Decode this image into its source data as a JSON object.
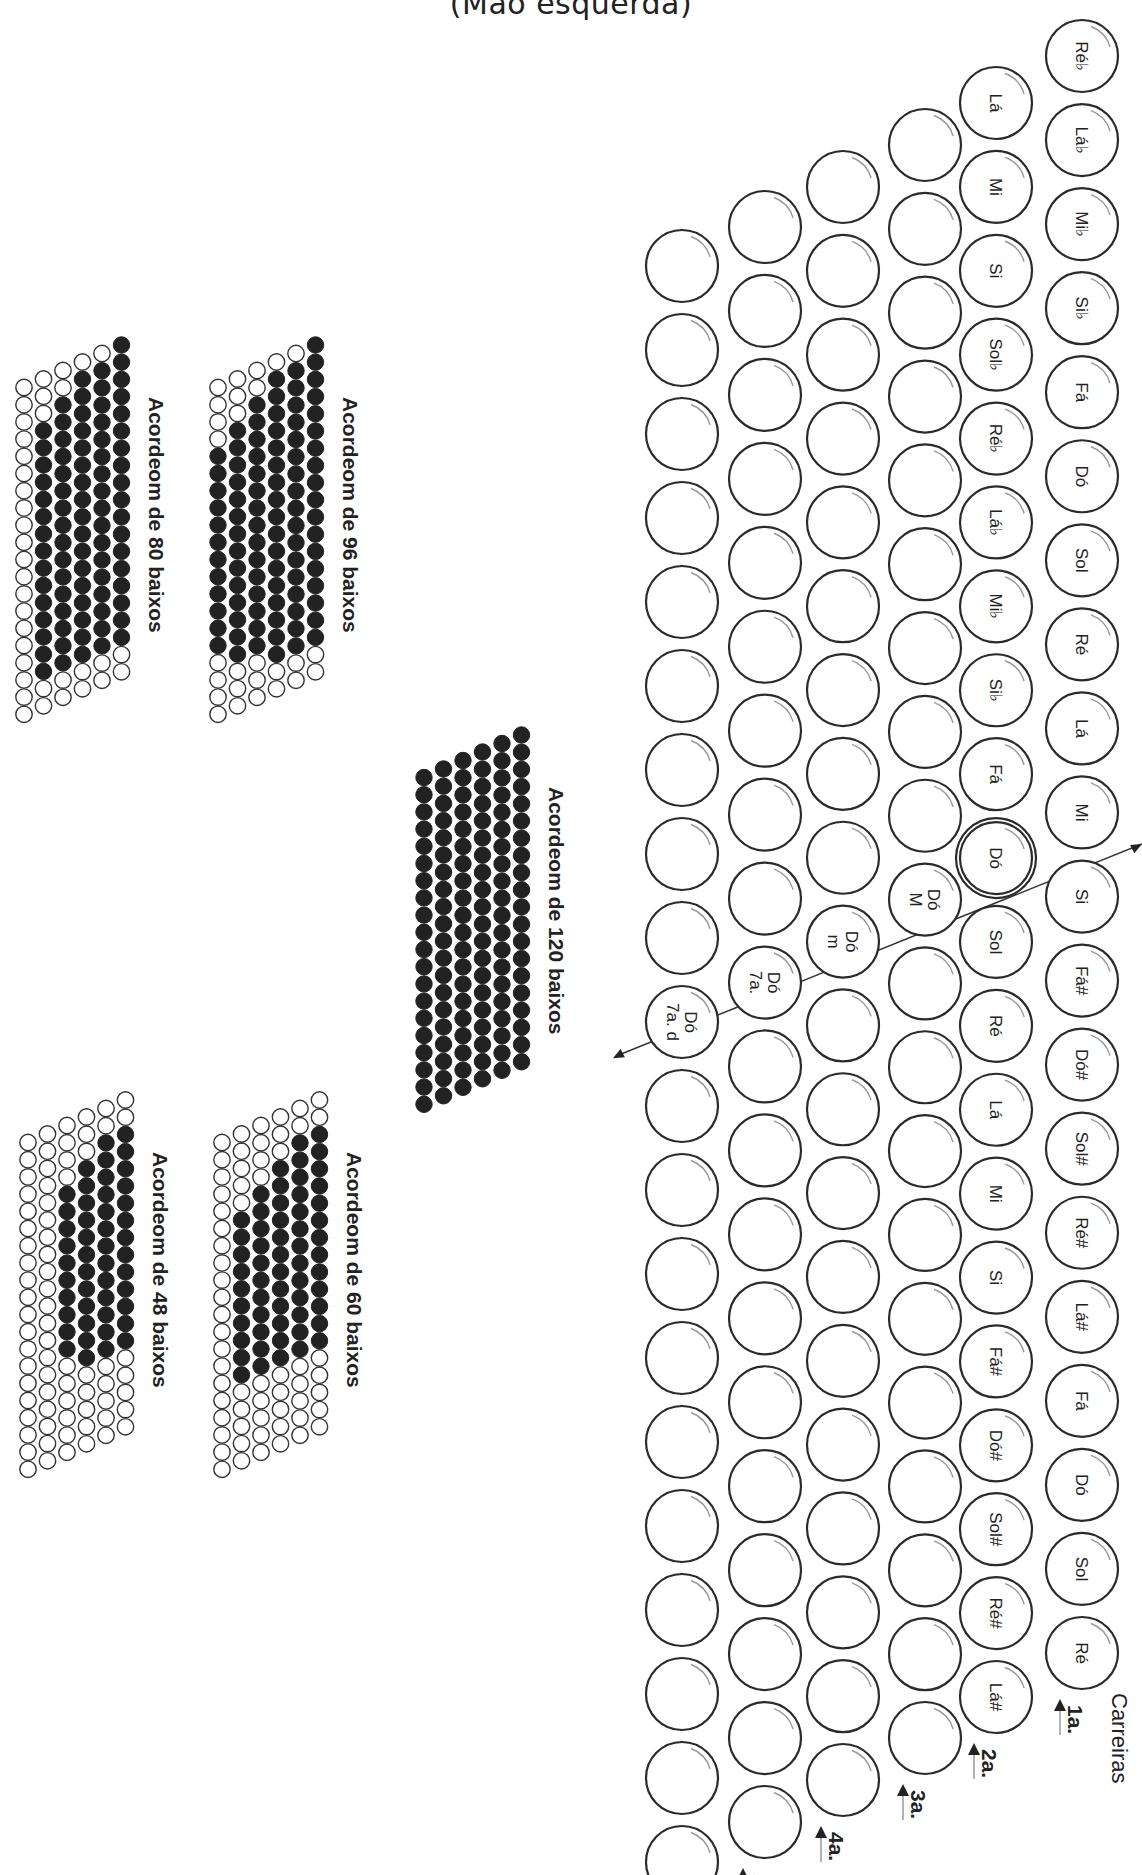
{
  "title": "(Mão esquerda)",
  "carreiras_label": "Carreiras",
  "rows": [
    {
      "label": "1a.",
      "x": 1082,
      "y0": 56,
      "y1": 1653,
      "buttons": [
        "Ré♭",
        "Lá♭",
        "Mi♭",
        "Si♭",
        "Fá",
        "Dó",
        "Sol",
        "Ré",
        "Lá",
        "Mi",
        "Si",
        "Fá#",
        "Dó#",
        "Sol#",
        "Ré#",
        "Lá#",
        "Fá",
        "Dó",
        "Sol",
        "Ré"
      ]
    },
    {
      "label": "2a.",
      "x": 996,
      "y0": 103,
      "y1": 1697,
      "buttons": [
        "Lá",
        "Mi",
        "Si",
        "Sol♭",
        "Ré♭",
        "Lá♭",
        "Mi♭",
        "Si♭",
        "Fá",
        "Dó",
        "Sol",
        "Ré",
        "Lá",
        "Mi",
        "Si",
        "Fá#",
        "Dó#",
        "Sol#",
        "Ré#",
        "Lá#"
      ]
    },
    {
      "label": "3a.",
      "x": 925,
      "y0": 145,
      "y1": 1738,
      "buttons": [
        "",
        "",
        "",
        "",
        "",
        "",
        "",
        "",
        "",
        "Dó\nM",
        "",
        "",
        "",
        "",
        "",
        "",
        "",
        "",
        "",
        ""
      ]
    },
    {
      "label": "4a.",
      "x": 843,
      "y0": 187,
      "y1": 1780,
      "buttons": [
        "",
        "",
        "",
        "",
        "",
        "",
        "",
        "",
        "",
        "Dó\nm",
        "",
        "",
        "",
        "",
        "",
        "",
        "",
        "",
        "",
        ""
      ]
    },
    {
      "label": "5a.",
      "x": 765,
      "y0": 227,
      "y1": 1822,
      "buttons": [
        "",
        "",
        "",
        "",
        "",
        "",
        "",
        "",
        "",
        "Dó\n7a.",
        "",
        "",
        "",
        "",
        "",
        "",
        "",
        "",
        "",
        ""
      ]
    },
    {
      "label": "6a.",
      "x": 682,
      "y0": 266,
      "y1": 1862,
      "buttons": [
        "",
        "",
        "",
        "",
        "",
        "",
        "",
        "",
        "",
        "Dó\n7a. d",
        "",
        "",
        "",
        "",
        "",
        "",
        "",
        "",
        "",
        ""
      ]
    }
  ],
  "highlighted_button": {
    "row": 1,
    "index": 9,
    "label": "Dó"
  },
  "layouts": [
    {
      "caption": "Acordeom de 96 baixos",
      "x": 218,
      "y": 345,
      "filled_rows": [
        [
          4,
          16
        ],
        [
          3,
          17
        ],
        [
          2,
          17
        ],
        [
          1,
          18
        ],
        [
          1,
          18
        ],
        [
          0,
          18
        ]
      ],
      "total": 20
    },
    {
      "caption": "Acordeom de 80 baixos",
      "x": 24,
      "y": 345,
      "filled_rows": [
        [
          0,
          0
        ],
        [
          3,
          18
        ],
        [
          2,
          18
        ],
        [
          1,
          18
        ],
        [
          1,
          18
        ],
        [
          0,
          18
        ]
      ],
      "total": 20
    },
    {
      "caption": "Acordeom de 120 baixos",
      "x": 424,
      "y": 735,
      "filled_rows": [
        [
          0,
          20
        ],
        [
          0,
          20
        ],
        [
          0,
          20
        ],
        [
          0,
          20
        ],
        [
          0,
          20
        ],
        [
          0,
          20
        ]
      ],
      "total": 20
    },
    {
      "caption": "Acordeom de 60 baixos",
      "x": 222,
      "y": 1100,
      "filled_rows": [
        [
          0,
          0
        ],
        [
          5,
          15
        ],
        [
          4,
          15
        ],
        [
          3,
          15
        ],
        [
          2,
          15
        ],
        [
          2,
          15
        ]
      ],
      "total": 20
    },
    {
      "caption": "Acordeom de 48 baixos",
      "x": 28,
      "y": 1100,
      "filled_rows": [
        [
          0,
          0
        ],
        [
          0,
          0
        ],
        [
          4,
          14
        ],
        [
          3,
          15
        ],
        [
          2,
          15
        ],
        [
          2,
          15
        ]
      ],
      "total": 20
    }
  ],
  "icons": {
    "row_arrow": "arrow-up-icon",
    "diagonal_arrow": "arrow-icon"
  }
}
